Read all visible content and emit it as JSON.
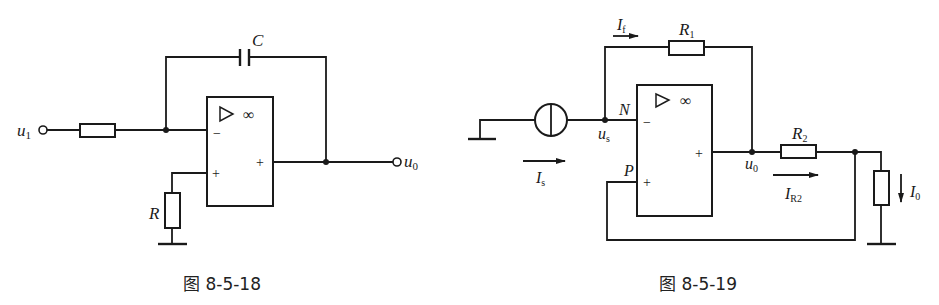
{
  "figures": [
    {
      "caption": "图 8-5-18",
      "labels": {
        "input": "u",
        "input_sub": "1",
        "output": "u",
        "output_sub": "0",
        "capacitor": "C",
        "resistor_ground": "R",
        "opamp_symbol": "▷",
        "opamp_gain": "∞",
        "inv_sign": "−",
        "noninv_sign": "+",
        "out_sign": "+"
      }
    },
    {
      "caption": "图 8-5-19",
      "labels": {
        "feedback_current": "I",
        "feedback_current_sub": "f",
        "r1": "R",
        "r1_sub": "1",
        "r2": "R",
        "r2_sub": "2",
        "node_n": "N",
        "node_p": "P",
        "source_voltage": "u",
        "source_voltage_sub": "s",
        "source_current": "I",
        "source_current_sub": "s",
        "output_voltage": "u",
        "output_voltage_sub": "0",
        "r2_current": "I",
        "r2_current_sub": "R2",
        "load_current": "I",
        "load_current_sub": "0",
        "opamp_symbol": "▷",
        "opamp_gain": "∞",
        "inv_sign": "−",
        "noninv_sign": "+",
        "out_sign": "+"
      }
    }
  ],
  "colors": {
    "ink": "#1a1a1a",
    "background": "#ffffff"
  }
}
